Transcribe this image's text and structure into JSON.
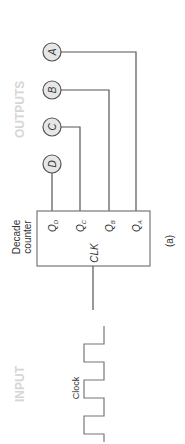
{
  "diagram": {
    "section_labels": {
      "outputs": "OUTPUTS",
      "input": "INPUT"
    },
    "counter": {
      "title_line1": "Decade",
      "title_line2": "counter",
      "clock_pin": "CLK",
      "outputs": [
        {
          "pin": "Q",
          "sub": "D",
          "indicator": "D"
        },
        {
          "pin": "Q",
          "sub": "C",
          "indicator": "C"
        },
        {
          "pin": "Q",
          "sub": "B",
          "indicator": "B"
        },
        {
          "pin": "Q",
          "sub": "A",
          "indicator": "A"
        }
      ]
    },
    "clock_label": "Clock",
    "caption": "(a)",
    "colors": {
      "wire": "#555555",
      "indicator_fill": "#e6e6e6",
      "ghost_text": "#d6d6d6"
    }
  }
}
